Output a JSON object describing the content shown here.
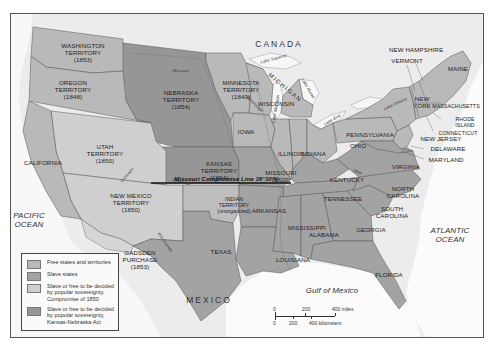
{
  "map": {
    "labels": {
      "canada": "CANADA",
      "mexico": "MEXICO",
      "pacific_ocean": [
        "PACIFIC",
        "OCEAN"
      ],
      "atlantic_ocean": [
        "ATLANTIC",
        "OCEAN"
      ],
      "gulf_of_mexico": "Gulf of Mexico",
      "missouri_compromise_line": "Missouri Compromise Line 36°30'N",
      "michigan": "MICHIGAN"
    },
    "territories": [
      {
        "name": "WASHINGTON",
        "line2": "TERRITORY",
        "year": "(1853)"
      },
      {
        "name": "OREGON",
        "line2": "TERRITORY",
        "year": "(1848)"
      },
      {
        "name": "NEBRASKA",
        "line2": "TERRITORY",
        "year": "(1854)"
      },
      {
        "name": "MINNESOTA",
        "line2": "TERRITORY",
        "year": "(1849)"
      },
      {
        "name": "UTAH",
        "line2": "TERRITORY",
        "year": "(1850)"
      },
      {
        "name": "KANSAS",
        "line2": "TERRITORY",
        "year": "(1854)"
      },
      {
        "name": "NEW MEXICO",
        "line2": "TERRITORY",
        "year": "(1850)"
      },
      {
        "name": "INDIAN",
        "line2": "TERRITORY",
        "year": "(unorganized)"
      },
      {
        "name": "GADSDEN",
        "line2": "PURCHASE",
        "year": "(1853)"
      }
    ],
    "states": {
      "california": "CALIFORNIA",
      "texas": "TEXAS",
      "iowa": "IOWA",
      "wisconsin": "WISCONSIN",
      "illinois": "ILLINOIS",
      "indiana": "INDIANA",
      "ohio": "OHIO",
      "missouri": "MISSOURI",
      "missouri_year": "(1820)",
      "kentucky": "KENTUCKY",
      "tennessee": "TENNESSEE",
      "arkansas": "ARKANSAS",
      "mississippi": "MISSISSIPPI",
      "alabama": "ALABAMA",
      "georgia": "GEORGIA",
      "louisiana": "LOUISIANA",
      "florida": "FLORIDA",
      "virginia": "VIRGINIA",
      "north_carolina": [
        "NORTH",
        "CAROLINA"
      ],
      "south_carolina": [
        "SOUTH",
        "CAROLINA"
      ],
      "pennsylvania": "PENNSYLVANIA",
      "new_york": [
        "NEW",
        "YORK"
      ],
      "maine": "MAINE",
      "new_hampshire": "NEW HAMPSHIRE",
      "vermont": "VERMONT",
      "massachusetts": "MASSACHUSETTS",
      "rhode_island": [
        "RHODE",
        "ISLAND"
      ],
      "connecticut": "CONNECTICUT",
      "new_jersey": "NEW JERSEY",
      "delaware": "DELAWARE",
      "maryland": "MARYLAND"
    },
    "water": {
      "lake_superior": "Lake Superior",
      "lake_michigan": "Lake Michigan",
      "lake_huron": "Lake Huron",
      "lake_erie": "Lake Erie",
      "lake_ontario": "Lake Ontario",
      "missouri_river": "Missouri",
      "mississippi_river": "Mississippi",
      "ohio_river": "Ohio",
      "colorado_river": "Colorado",
      "arkansas_river": "Arkansas",
      "rio_grande": "Rio Grande"
    }
  },
  "legend": {
    "items": [
      {
        "label": "Free states and territories",
        "color": "#b9b9b9"
      },
      {
        "label": "Slave states",
        "color": "#a3a3a3"
      },
      {
        "label": "Slave or free to be decided by popular sovereignty, Compromise of 1850",
        "color": "#cfcfcf"
      },
      {
        "label": "Slave or free to be decided by popular sovereignty, Kansas-Nebraska Act",
        "color": "#969696"
      }
    ]
  },
  "scale": {
    "miles_0": "0",
    "miles_200": "200",
    "miles_400": "400 miles",
    "km_0": "0",
    "km_200": "200",
    "km_400": "400 kilometers"
  },
  "colors": {
    "background": "#f2f2f2",
    "free": "#b9b9b9",
    "slave": "#a3a3a3",
    "compromise_1850": "#cfcfcf",
    "kansas_nebraska": "#969696",
    "foreign": "#e4e4e4"
  }
}
